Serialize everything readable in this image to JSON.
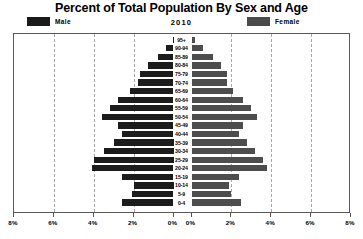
{
  "header": {
    "title": "Percent of Total Population By Sex and Age",
    "year": "2010"
  },
  "legend": {
    "male_label": "Male",
    "female_label": "Female",
    "male_color": "#1c1c1c",
    "female_color": "#4d4d4d"
  },
  "chart_data": {
    "type": "bar",
    "subtype": "population-pyramid",
    "title": "Percent of Total Population By Sex and Age",
    "subtitle": "2010",
    "xlabel": "",
    "ylabel": "",
    "xlim": [
      0,
      8
    ],
    "x_tick_labels_left": [
      "8%",
      "6%",
      "4%",
      "2%",
      "0%"
    ],
    "x_tick_labels_right": [
      "0%",
      "2%",
      "4%",
      "6%",
      "8%"
    ],
    "x_tick_values": [
      8,
      6,
      4,
      2,
      0,
      0,
      2,
      4,
      6,
      8
    ],
    "grid": true,
    "grid_style": "dashed-vertical",
    "legend_position": "top",
    "categories": [
      "95+",
      "90-94",
      "85-89",
      "80-84",
      "75-79",
      "70-74",
      "65-69",
      "60-64",
      "55-59",
      "50-54",
      "45-49",
      "40-44",
      "35-39",
      "30-34",
      "25-29",
      "20-24",
      "15-19",
      "10-14",
      "5-9",
      "0-4"
    ],
    "series": [
      {
        "name": "Male",
        "side": "left",
        "color": "#1c1c1c",
        "values": [
          0.05,
          0.4,
          0.8,
          1.3,
          1.7,
          1.8,
          2.2,
          2.8,
          3.2,
          3.6,
          2.8,
          2.6,
          3.0,
          3.5,
          4.0,
          4.1,
          2.6,
          2.0,
          2.1,
          2.6
        ]
      },
      {
        "name": "Female",
        "side": "right",
        "color": "#4d4d4d",
        "values": [
          0.2,
          0.6,
          1.1,
          1.5,
          1.8,
          1.8,
          2.1,
          2.6,
          3.0,
          3.3,
          2.6,
          2.4,
          2.8,
          3.2,
          3.6,
          3.8,
          2.4,
          1.9,
          2.0,
          2.5
        ]
      }
    ]
  }
}
